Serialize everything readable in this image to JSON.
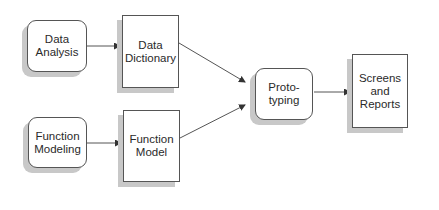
{
  "diagram": {
    "nodes": [
      {
        "id": "data-analysis",
        "label": "Data\nAnalysis",
        "shape": "rounded-rect"
      },
      {
        "id": "data-dictionary",
        "label": "Data\nDictionary",
        "shape": "rect"
      },
      {
        "id": "function-modeling",
        "label": "Function\nModeling",
        "shape": "rounded-rect"
      },
      {
        "id": "function-model",
        "label": "Function\nModel",
        "shape": "rect"
      },
      {
        "id": "prototyping",
        "label": "Proto-\ntyping",
        "shape": "rounded-rect"
      },
      {
        "id": "screens-reports",
        "label": "Screens\nand\nReports",
        "shape": "rect"
      }
    ],
    "edges": [
      {
        "from": "data-analysis",
        "to": "data-dictionary"
      },
      {
        "from": "function-modeling",
        "to": "function-model"
      },
      {
        "from": "data-dictionary",
        "to": "prototyping"
      },
      {
        "from": "function-model",
        "to": "prototyping"
      },
      {
        "from": "prototyping",
        "to": "screens-reports"
      }
    ],
    "colors": {
      "stroke": "#555555",
      "shadow": "#c8c8c8",
      "background": "#ffffff"
    }
  }
}
